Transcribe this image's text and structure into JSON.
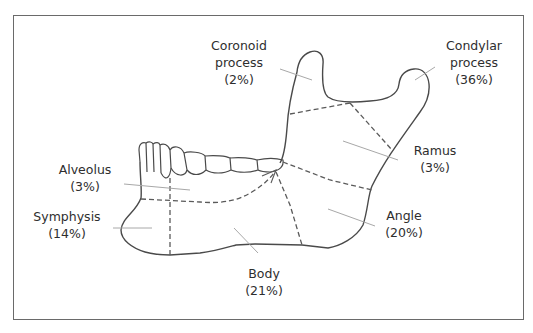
{
  "diagram": {
    "regions": [
      {
        "id": "coronoid",
        "name_line1": "Coronoid",
        "name_line2": "process",
        "percent": "(2%)"
      },
      {
        "id": "condylar",
        "name_line1": "Condylar",
        "name_line2": "process",
        "percent": "(36%)"
      },
      {
        "id": "ramus",
        "name_line1": "Ramus",
        "percent": "(3%)"
      },
      {
        "id": "alveolus",
        "name_line1": "Alveolus",
        "percent": "(3%)"
      },
      {
        "id": "symphysis",
        "name_line1": "Symphysis",
        "percent": "(14%)"
      },
      {
        "id": "angle",
        "name_line1": "Angle",
        "percent": "(20%)"
      },
      {
        "id": "body",
        "name_line1": "Body",
        "percent": "(21%)"
      }
    ],
    "colors": {
      "outline": "#4a4a4a",
      "dashed": "#5a5a5a",
      "leader": "#a8a8a8",
      "text": "#2e2e2e",
      "frame": "#6a6a6a"
    }
  }
}
